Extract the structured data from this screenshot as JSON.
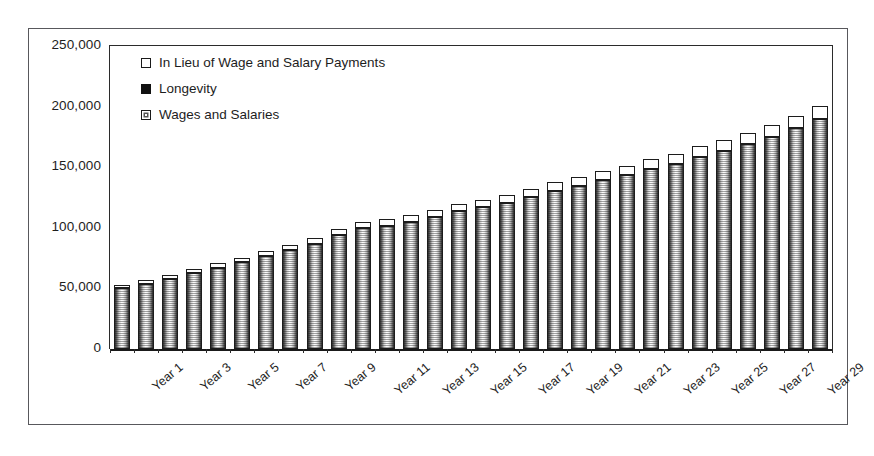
{
  "chart_data": {
    "type": "bar",
    "stacked": true,
    "title": "",
    "subtitle": "",
    "xlabel": "",
    "ylabel": "",
    "ylim": [
      0,
      250000
    ],
    "ytick_labels": [
      "250,000",
      "200,000",
      "150,000",
      "100,000",
      "50,000",
      "0"
    ],
    "ytick_values": [
      250000,
      200000,
      150000,
      100000,
      50000,
      0
    ],
    "grid": false,
    "legend_position": "top-left",
    "categories": [
      "Year 1",
      "Year 2",
      "Year 3",
      "Year 4",
      "Year 5",
      "Year 6",
      "Year 7",
      "Year 8",
      "Year 9",
      "Year 10",
      "Year 11",
      "Year 12",
      "Year 13",
      "Year 14",
      "Year 15",
      "Year 16",
      "Year 17",
      "Year 18",
      "Year 19",
      "Year 20",
      "Year 21",
      "Year 22",
      "Year 23",
      "Year 24",
      "Year 25",
      "Year 26",
      "Year 27",
      "Year 28",
      "Year 29",
      "Year 30"
    ],
    "visible_tick_labels": [
      "Year 1",
      "Year 3",
      "Year 5",
      "Year 7",
      "Year 9",
      "Year 11",
      "Year 13",
      "Year 15",
      "Year 17",
      "Year 19",
      "Year 21",
      "Year 23",
      "Year 25",
      "Year 27",
      "Year 29"
    ],
    "series": [
      {
        "name": "Wages and Salaries",
        "marker": "hatched-cylinder",
        "values": [
          50000,
          54000,
          58000,
          62500,
          67000,
          71500,
          76500,
          81500,
          87000,
          94000,
          99500,
          101500,
          104500,
          109000,
          113500,
          117000,
          120500,
          125500,
          130500,
          134500,
          139500,
          143500,
          148500,
          153000,
          158500,
          163500,
          169000,
          175000,
          182500,
          190000
        ]
      },
      {
        "name": "Longevity",
        "marker": "solid-black",
        "values": [
          0,
          0,
          0,
          0,
          0,
          0,
          0,
          0,
          0,
          0,
          0,
          0,
          0,
          0,
          0,
          0,
          0,
          0,
          0,
          0,
          0,
          0,
          0,
          0,
          0,
          0,
          0,
          0,
          0,
          0
        ]
      },
      {
        "name": "In Lieu of Wage and Salary Payments",
        "marker": "white-square",
        "values": [
          3000,
          3200,
          3400,
          3600,
          3800,
          4000,
          4300,
          4500,
          4800,
          5000,
          5200,
          5400,
          5700,
          5900,
          6100,
          6300,
          6600,
          6800,
          7000,
          7300,
          7500,
          7800,
          8000,
          8300,
          8600,
          8900,
          9200,
          9500,
          9800,
          10200
        ]
      }
    ],
    "totals": [
      53000,
      57200,
      61400,
      66100,
      70800,
      75500,
      80800,
      86000,
      91800,
      99000,
      104700,
      106900,
      110200,
      114900,
      119600,
      123300,
      127100,
      132300,
      137500,
      141800,
      147000,
      151300,
      156500,
      161300,
      167100,
      172400,
      178200,
      184500,
      192300,
      200200
    ]
  },
  "legend": {
    "items": [
      {
        "label": "In Lieu of Wage and Salary Payments",
        "marker": "white-square"
      },
      {
        "label": "Longevity",
        "marker": "solid-black-square"
      },
      {
        "label": "Wages and Salaries",
        "marker": "hatched-square"
      }
    ]
  },
  "colors": {
    "axis": "#1d1d1d",
    "frame_border": "#58585c",
    "plot_background": "#ffffff",
    "bar_outline": "#1c1c1c",
    "longevity_fill": "#111111",
    "inlieu_fill": "#ffffff"
  }
}
